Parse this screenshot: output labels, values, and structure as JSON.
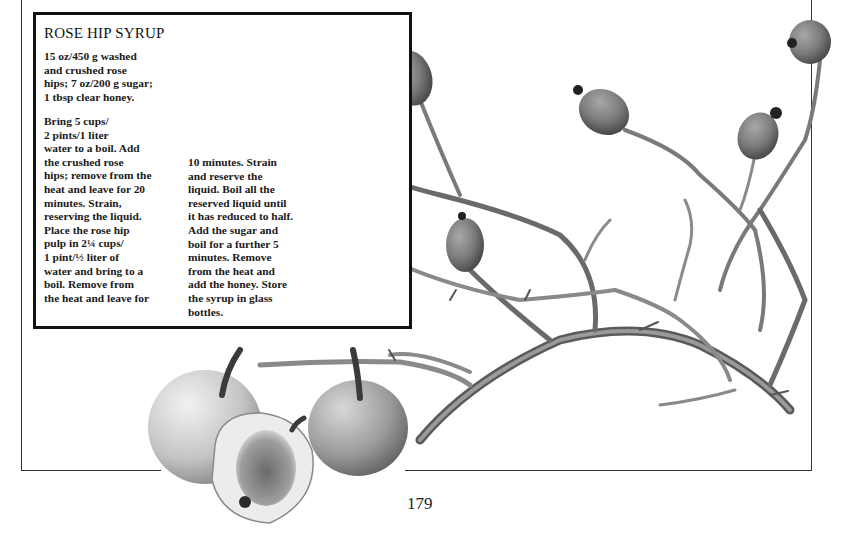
{
  "recipe": {
    "title": "ROSE HIP SYRUP",
    "ingredients_lines": [
      "15 oz/450 g washed",
      "and crushed rose",
      "hips; 7 oz/200 g sugar;",
      "1 tbsp clear honey."
    ],
    "method_col1_lines": [
      "Bring 5 cups/",
      "2 pints/1 liter",
      "water to a boil. Add",
      "the crushed rose",
      "hips; remove from the",
      "heat and leave for 20",
      "minutes. Strain,",
      "reserving the liquid.",
      "Place the rose hip",
      "pulp in 2¼ cups/",
      "1 pint/½ liter of",
      "water and bring to a",
      "boil. Remove from",
      "the heat and leave for"
    ],
    "method_col2_lines": [
      "10 minutes. Strain",
      "and reserve the",
      "liquid. Boil all the",
      "reserved liquid until",
      "it has reduced to half.",
      "Add the sugar and",
      "boil for a further 5",
      "minutes. Remove",
      "from the heat and",
      "add the honey. Store",
      "the syrup in glass",
      "bottles."
    ]
  },
  "illustration": {
    "subject": "rose hip branch with hips and three apples",
    "colors": {
      "hip": "#7a7a7a",
      "hip_dark": "#3a3a3a",
      "stem": "#8e8e8e",
      "stem_dark": "#555555",
      "apple": "#c9c9c9",
      "apple_shade": "#8a8a8a"
    }
  },
  "page_number": "179"
}
